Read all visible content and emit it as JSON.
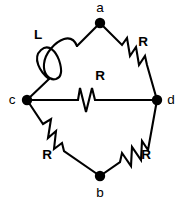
{
  "figure": {
    "background_color": "#ffffff",
    "stroke_color": "#000000",
    "width": 182,
    "height": 208
  },
  "nodes": [
    {
      "id": "a",
      "label": "a",
      "x": 100,
      "y": 23,
      "label_x": 100,
      "label_y": 8
    },
    {
      "id": "c",
      "label": "c",
      "x": 27,
      "y": 100,
      "label_x": 12,
      "label_y": 100
    },
    {
      "id": "d",
      "label": "d",
      "x": 157,
      "y": 100,
      "label_x": 171,
      "label_y": 100
    },
    {
      "id": "b",
      "label": "b",
      "x": 100,
      "y": 176,
      "label_x": 100,
      "label_y": 193
    }
  ],
  "components": [
    {
      "id": "branch-c-a",
      "type": "inductor",
      "label": "L",
      "label_x": 38,
      "label_y": 35,
      "from": "c",
      "to": "a"
    },
    {
      "id": "branch-a-d",
      "type": "resistor",
      "label": "R",
      "label_x": 143,
      "label_y": 42,
      "from": "a",
      "to": "d"
    },
    {
      "id": "branch-c-d",
      "type": "resistor",
      "label": "R",
      "label_x": 100,
      "label_y": 76,
      "from": "c",
      "to": "d"
    },
    {
      "id": "branch-c-b",
      "type": "resistor",
      "label": "R",
      "label_x": 47,
      "label_y": 155,
      "from": "c",
      "to": "b"
    },
    {
      "id": "branch-b-d",
      "type": "resistor",
      "label": "R",
      "label_x": 146,
      "label_y": 155,
      "from": "b",
      "to": "d"
    }
  ],
  "geometry": {
    "wire_c_to_coil": "M 27,100 L 49,79",
    "coil_path": "M 49,79 C 40,72 32,58 41,50 C 49,43 56,52 59,60 C 62,69 62,77 56,79 C 49,81 43,73 44,64 C 45,53 55,42 64,39 C 71,37 75,41 77,46",
    "wire_coil_to_a": "M 77,46 L 100,23",
    "wire_a_to_d": "M 100,23 L 122,45 L 127,38 L 130,56 L 136,47 L 139,65 L 145,56 L 147,65 L 157,100",
    "wire_c_to_d": "M 27,100 L 78,100 L 80,88 L 86,112 L 92,88 L 95,100 L 157,100",
    "wire_c_to_b": "M 27,100 L 43,124 L 51,119 L 48,138 L 56,131 L 54,149 L 62,143 L 64,151 L 100,176",
    "wire_b_to_d": "M 100,176 L 120,162 L 122,153 L 131,166 L 132,147 L 141,160 L 142,141 L 148,150 L 157,100",
    "node_radius": 5.2
  }
}
